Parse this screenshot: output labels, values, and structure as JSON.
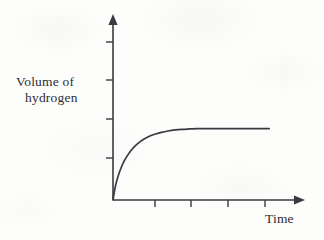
{
  "figure": {
    "background_color": "#fdfdfc",
    "ink_color": "#3a3a40",
    "width": 324,
    "height": 240
  },
  "y_axis": {
    "title_line1": "Volume of",
    "title_line2": "hydrogen"
  },
  "x_axis": {
    "title": "Time"
  },
  "chart_data": {
    "type": "line",
    "title": "",
    "subtitle": "",
    "xlabel": "Time",
    "ylabel": "Volume of hydrogen",
    "grid": false,
    "legend": false,
    "legend_position": "none",
    "axis_style": {
      "arrow_heads": true,
      "tick_labels": false,
      "x_tick_count": 5,
      "y_tick_count": 5,
      "x_tick_positions": [
        1,
        2,
        3,
        4,
        5
      ],
      "y_tick_positions": [
        1,
        2,
        3,
        4,
        5
      ]
    },
    "xlim": [
      0,
      5.6
    ],
    "ylim": [
      0,
      5.0
    ],
    "annotation": "Curve rises steeply from the origin, the gradient decreases progressively, and the volume levels off to a constant plateau value.",
    "series": [
      {
        "name": "Volume of hydrogen",
        "color": "#3a3a40",
        "plateau_value": 2.1,
        "x": [
          0.0,
          0.08,
          0.17,
          0.26,
          0.36,
          0.47,
          0.59,
          0.72,
          0.86,
          1.01,
          1.18,
          1.36,
          1.55,
          1.76,
          1.98,
          2.21,
          2.45,
          2.7,
          2.96,
          3.23,
          3.5,
          3.8,
          4.1,
          4.4,
          4.7,
          5.0
        ],
        "y": [
          0.0,
          0.42,
          0.72,
          0.95,
          1.15,
          1.32,
          1.47,
          1.6,
          1.71,
          1.8,
          1.88,
          1.94,
          1.99,
          2.03,
          2.06,
          2.08,
          2.09,
          2.1,
          2.1,
          2.1,
          2.1,
          2.1,
          2.1,
          2.1,
          2.1,
          2.1
        ]
      }
    ]
  }
}
